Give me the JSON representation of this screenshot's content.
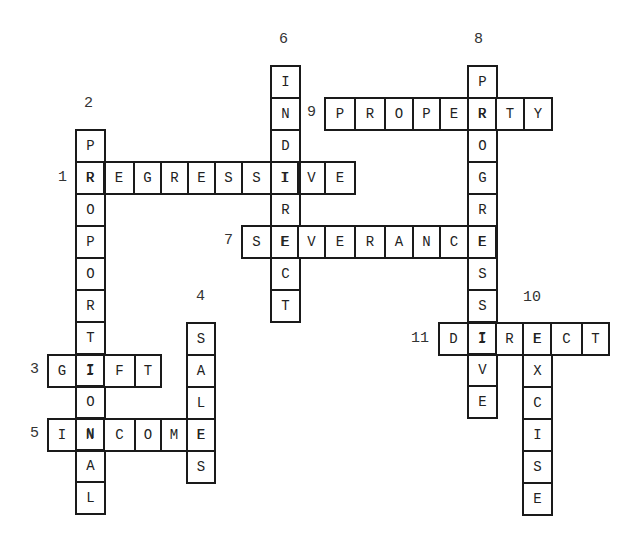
{
  "puzzle": {
    "cell_height": 32,
    "words": [
      {
        "number": "1",
        "direction": "across",
        "answer": "REGRESSIVE",
        "y": 161,
        "xs": [
          75,
          103,
          133,
          160,
          187,
          214,
          241,
          270,
          297,
          324
        ],
        "end_x": 354,
        "label_pos": [
          58,
          170
        ]
      },
      {
        "number": "2",
        "direction": "down",
        "answer": "PROPORTIONAL",
        "x": 75,
        "width": 29,
        "y_start": 129,
        "label_pos": [
          84,
          96
        ]
      },
      {
        "number": "3",
        "direction": "across",
        "answer": "GIFT",
        "y": 354,
        "xs": [
          47,
          75,
          103,
          134
        ],
        "end_x": 160,
        "label_pos": [
          30,
          362
        ]
      },
      {
        "number": "4",
        "direction": "down",
        "answer": "SALES",
        "x": 186,
        "width": 28,
        "y_start": 322,
        "label_pos": [
          196,
          289
        ]
      },
      {
        "number": "5",
        "direction": "across",
        "answer": "INCOME",
        "y": 418,
        "xs": [
          47,
          75,
          103,
          134,
          160,
          186
        ],
        "end_x": 214,
        "label_pos": [
          30,
          426
        ]
      },
      {
        "number": "6",
        "direction": "down",
        "answer": "INDIRECT",
        "x": 270,
        "width": 29,
        "y_start": 65,
        "label_pos": [
          279,
          32
        ]
      },
      {
        "number": "7",
        "direction": "across",
        "answer": "SEVERANCE",
        "y": 225,
        "xs": [
          241,
          270,
          297,
          324,
          354,
          384,
          412,
          439,
          467
        ],
        "end_x": 495,
        "label_pos": [
          224,
          233
        ]
      },
      {
        "number": "8",
        "direction": "down",
        "answer": "PROGRESSIVE",
        "x": 467,
        "width": 29,
        "y_start": 65,
        "label_pos": [
          474,
          32
        ]
      },
      {
        "number": "9",
        "direction": "across",
        "answer": "PROPERTY",
        "y": 97,
        "xs": [
          324,
          354,
          384,
          412,
          439,
          467,
          495,
          523
        ],
        "end_x": 551,
        "label_pos": [
          307,
          105
        ]
      },
      {
        "number": "10",
        "direction": "down",
        "answer": "EXCISE",
        "x": 522,
        "width": 29,
        "y_start": 322,
        "label_pos": [
          523,
          290
        ]
      },
      {
        "number": "11",
        "direction": "across",
        "answer": "DIRECT",
        "y": 322,
        "xs": [
          438,
          467,
          495,
          522,
          550,
          581
        ],
        "end_x": 608,
        "label_pos": [
          411,
          331
        ]
      }
    ]
  }
}
